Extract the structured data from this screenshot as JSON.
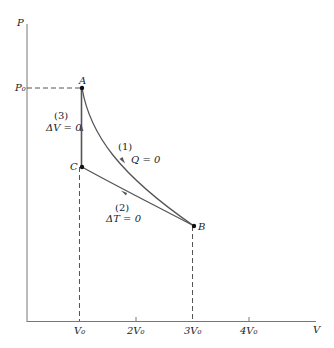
{
  "diagram": {
    "type": "pv-diagram",
    "axes": {
      "y_label": "P",
      "x_label": "V",
      "y_ticks": [
        {
          "label": "P₀",
          "value": "P0"
        }
      ],
      "x_ticks": [
        {
          "label": "V₀",
          "value": 1
        },
        {
          "label": "2V₀",
          "value": 2
        },
        {
          "label": "3V₀",
          "value": 3
        },
        {
          "label": "4V₀",
          "value": 4
        }
      ]
    },
    "points": [
      {
        "name": "A",
        "V": "V0",
        "P": "P0"
      },
      {
        "name": "B",
        "V": "3V0",
        "P": "lower"
      },
      {
        "name": "C",
        "V": "V0",
        "P": "middle"
      }
    ],
    "processes": [
      {
        "id": "(1)",
        "label": "(1)",
        "condition": "Q = 0",
        "from": "A",
        "to": "B",
        "kind": "adiabatic"
      },
      {
        "id": "(2)",
        "label": "(2)",
        "condition": "ΔT = 0",
        "from": "B",
        "to": "C",
        "kind": "isothermal"
      },
      {
        "id": "(3)",
        "label": "(3)",
        "condition": "ΔV = 0",
        "from": "C",
        "to": "A",
        "kind": "isochoric"
      }
    ],
    "colors": {
      "curve": "#555555",
      "axis": "#666666",
      "point": "#111111"
    }
  }
}
